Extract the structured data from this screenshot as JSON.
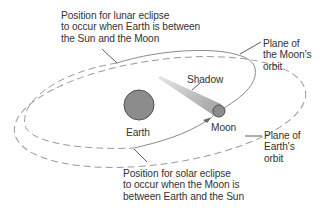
{
  "labels": {
    "lunar_eclipse": [
      "Position for lunar eclipse",
      "to occur when Earth is between",
      "the Sun and the Moon"
    ],
    "moon_orbit_plane": [
      "Plane of",
      "the Moon's",
      "orbit"
    ],
    "shadow": "Shadow",
    "earth": "Earth",
    "moon": "Moon",
    "earth_orbit_plane": [
      "Plane of",
      "Earth's",
      "orbit"
    ],
    "solar_eclipse": [
      "Position for solar eclipse",
      "to occur when the Moon is",
      "between Earth and the Sun"
    ]
  },
  "colors": {
    "background": "#ffffff",
    "text": "#333333",
    "body_fill": "#8c8c8c",
    "body_stroke": "#505050",
    "orbit_solid": "#8a8a8a",
    "orbit_dashed": "#9a9a9a",
    "shadow": "#b4b4b4",
    "leader": "#333333"
  }
}
